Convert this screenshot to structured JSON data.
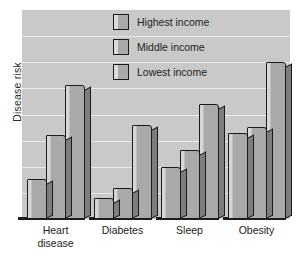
{
  "chart_data": {
    "type": "bar",
    "title": "",
    "subtitle": "",
    "xlabel": "",
    "ylabel": "Disease risk",
    "categories": [
      "Heart disease",
      "Diabetes",
      "Sleep",
      "Obesity"
    ],
    "category_lines": [
      [
        "Heart",
        "disease"
      ],
      [
        "Diabetes"
      ],
      [
        "Sleep"
      ],
      [
        "Obesity"
      ]
    ],
    "series": [
      {
        "name": "Highest income",
        "values": [
          19,
          10,
          25,
          41
        ]
      },
      {
        "name": "Middle income",
        "values": [
          40,
          15,
          33,
          44
        ]
      },
      {
        "name": "Lowest income",
        "values": [
          64,
          45,
          55,
          75
        ]
      }
    ],
    "ylim": [
      0,
      100
    ],
    "y_tick_labels": [],
    "x_tick_labels": [
      "Heart disease",
      "Diabetes",
      "Sleep",
      "Obesity"
    ],
    "grid": true,
    "gridline_count": 7,
    "legend_position": "inside-top-center",
    "style": "3d-grayscale",
    "colors": {
      "plot_background": "#c9c9c9",
      "page_background": "#ffffff",
      "bar_face": "#a9a9a9",
      "bar_highlight": "#d6d6d6",
      "bar_side": "#7d7d7d",
      "bar_outline": "#1b1b1b",
      "gridline": "#ffffff",
      "axis": "#1d1d1d",
      "text": "#222222"
    }
  },
  "legend": {
    "items": [
      {
        "label": "Highest income",
        "swatch": "legend-swatch-highest"
      },
      {
        "label": "Middle income",
        "swatch": "legend-swatch-middle"
      },
      {
        "label": "Lowest income",
        "swatch": "legend-swatch-lowest"
      }
    ]
  },
  "axes": {
    "y_title": "Disease risk"
  }
}
